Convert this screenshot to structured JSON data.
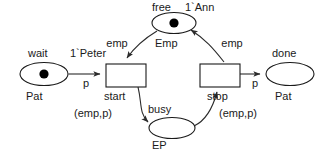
{
  "diagram": {
    "type": "colored-petri-net",
    "background": "#ffffff",
    "ink_color": "#1a1a1a",
    "arc_color": "#2b2b2b",
    "token_color": "#000000"
  },
  "places": [
    {
      "id": "wait",
      "name": "wait",
      "colorset": "Pat",
      "marking": "1`Peter",
      "tokens": 1,
      "cx": 44,
      "cy": 74,
      "rx": 24,
      "ry": 11.5
    },
    {
      "id": "free",
      "name": "free",
      "colorset": "Emp",
      "marking": "1`Ann",
      "tokens": 1,
      "cx": 174,
      "cy": 23,
      "rx": 22,
      "ry": 10.5
    },
    {
      "id": "busy",
      "name": "busy",
      "colorset": "EP",
      "marking": "",
      "tokens": 0,
      "cx": 172,
      "cy": 128,
      "rx": 23,
      "ry": 10.5
    },
    {
      "id": "done",
      "name": "done",
      "colorset": "Pat",
      "marking": "",
      "tokens": 0,
      "cx": 290,
      "cy": 74,
      "rx": 24,
      "ry": 11.5
    }
  ],
  "transitions": [
    {
      "id": "start",
      "name": "start",
      "x": 106,
      "y": 64,
      "w": 40,
      "h": 23
    },
    {
      "id": "stop",
      "name": "stop",
      "x": 200,
      "y": 64,
      "w": 40,
      "h": 23
    }
  ],
  "arcs": [
    {
      "id": "wait-to-start",
      "from": "wait",
      "to": "start",
      "label": "p",
      "lx": 86,
      "ly": 84
    },
    {
      "id": "free-to-start",
      "from": "free",
      "to": "start",
      "label": "emp",
      "lx": 117,
      "ly": 44
    },
    {
      "id": "start-to-busy",
      "from": "start",
      "to": "busy",
      "label": "(emp,p)",
      "lx": 93,
      "ly": 114
    },
    {
      "id": "busy-to-stop",
      "from": "busy",
      "to": "stop",
      "label": "(emp,p)",
      "lx": 238,
      "ly": 114
    },
    {
      "id": "stop-to-free",
      "from": "stop",
      "to": "free",
      "label": "emp",
      "lx": 232,
      "ly": 44
    },
    {
      "id": "stop-to-done",
      "from": "stop",
      "to": "done",
      "label": "p",
      "lx": 255,
      "ly": 84
    }
  ],
  "labels": {
    "wait_name": {
      "text": "wait",
      "x": 28,
      "y": 54,
      "anchor": "start"
    },
    "wait_marking": {
      "text": "1`Peter",
      "x": 70,
      "y": 54,
      "anchor": "start"
    },
    "wait_colorset": {
      "text": "Pat",
      "x": 26,
      "y": 97,
      "anchor": "start"
    },
    "free_name": {
      "text": "free",
      "x": 152,
      "y": 8,
      "anchor": "start"
    },
    "free_marking": {
      "text": "1`Ann",
      "x": 185,
      "y": 8,
      "anchor": "start"
    },
    "free_colorset": {
      "text": "Emp",
      "x": 155,
      "y": 44,
      "anchor": "start"
    },
    "busy_name": {
      "text": "busy",
      "x": 148,
      "y": 110,
      "anchor": "start"
    },
    "busy_colorset": {
      "text": "EP",
      "x": 152,
      "y": 146,
      "anchor": "start"
    },
    "done_name": {
      "text": "done",
      "x": 272,
      "y": 54,
      "anchor": "start"
    },
    "done_colorset": {
      "text": "Pat",
      "x": 275,
      "y": 97,
      "anchor": "start"
    },
    "start_name": {
      "text": "start",
      "x": 104,
      "y": 97,
      "anchor": "start"
    },
    "stop_name": {
      "text": "stop",
      "x": 207,
      "y": 97,
      "anchor": "start"
    }
  }
}
